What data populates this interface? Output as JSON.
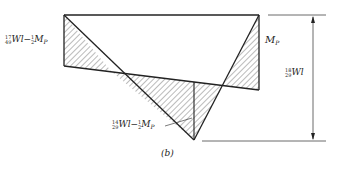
{
  "figure": {
    "caption": "(b)",
    "labels": {
      "left": {
        "frac1": [
          "1",
          "4"
        ],
        "frac2": [
          "7",
          "9"
        ],
        "term1": "Wl",
        "op": "−",
        "frac3": [
          "1",
          "2"
        ],
        "term2": "M",
        "sub": "P"
      },
      "right_top": {
        "term": "M",
        "sub": "P"
      },
      "dimension": {
        "frac1": [
          "1",
          "2"
        ],
        "frac2": [
          "8",
          "9"
        ],
        "term": "Wl"
      },
      "bottom": {
        "frac1": [
          "1",
          "2"
        ],
        "frac2": [
          "4",
          "9"
        ],
        "term1": "Wl",
        "op": "−",
        "frac3": [
          "1",
          "2"
        ],
        "term2": "M",
        "sub": "P"
      }
    },
    "colors": {
      "line": "#222222",
      "hatch": "#555555",
      "background": "#ffffff"
    }
  }
}
